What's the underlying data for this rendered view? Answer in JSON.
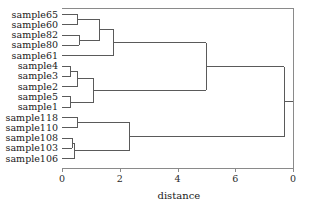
{
  "chart_data": {
    "type": "dendrogram",
    "title": "",
    "xlabel": "distance",
    "ylabel": "",
    "orientation": "horizontal",
    "grid": false,
    "legend": null,
    "xlim": [
      0,
      8
    ],
    "xticks": [
      0,
      2,
      4,
      6,
      8
    ],
    "xticklabels": [
      "0",
      "2",
      "4",
      "6",
      "0"
    ],
    "leaves": [
      "sample65",
      "sample60",
      "sample82",
      "sample80",
      "sample61",
      "sample4",
      "sample3",
      "sample2",
      "sample5",
      "sample1",
      "sample118",
      "sample110",
      "sample108",
      "sample103",
      "sample106"
    ],
    "merges": [
      {
        "id": "m1",
        "children": [
          "sample65",
          "sample60"
        ],
        "height": 0.55
      },
      {
        "id": "m2",
        "children": [
          "sample82",
          "sample80"
        ],
        "height": 0.6
      },
      {
        "id": "m3",
        "children": [
          "m1",
          "m2"
        ],
        "height": 1.3
      },
      {
        "id": "m4",
        "children": [
          "m3",
          "sample61"
        ],
        "height": 1.8
      },
      {
        "id": "m5",
        "children": [
          "sample4",
          "sample3"
        ],
        "height": 0.3
      },
      {
        "id": "m6",
        "children": [
          "m5",
          "sample2"
        ],
        "height": 0.55
      },
      {
        "id": "m7",
        "children": [
          "sample5",
          "sample1"
        ],
        "height": 0.3
      },
      {
        "id": "m8",
        "children": [
          "m6",
          "m7"
        ],
        "height": 1.1
      },
      {
        "id": "m9",
        "children": [
          "m4",
          "m8"
        ],
        "height": 5.0
      },
      {
        "id": "m10",
        "children": [
          "sample118",
          "sample110"
        ],
        "height": 0.55
      },
      {
        "id": "m11",
        "children": [
          "sample108",
          "sample103"
        ],
        "height": 0.35
      },
      {
        "id": "m12",
        "children": [
          "m11",
          "sample106"
        ],
        "height": 0.45
      },
      {
        "id": "m13",
        "children": [
          "m10",
          "m12"
        ],
        "height": 2.35
      },
      {
        "id": "m14",
        "children": [
          "m9",
          "m13"
        ],
        "height": 7.7
      }
    ],
    "line_color": "#5a5a5a",
    "axis_color": "#8a8a8a"
  }
}
